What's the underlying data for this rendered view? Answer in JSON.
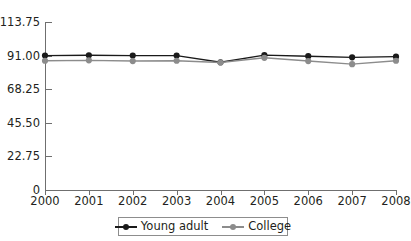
{
  "chart_data": {
    "type": "line",
    "title": "",
    "xlabel": "",
    "ylabel": "",
    "x": [
      "2000",
      "2001",
      "2002",
      "2003",
      "2004",
      "2005",
      "2006",
      "2007",
      "2008"
    ],
    "categories": [
      "2000",
      "2001",
      "2002",
      "2003",
      "2004",
      "2005",
      "2006",
      "2007",
      "2008"
    ],
    "series": [
      {
        "name": "Young adult",
        "color": "#1a1a1a",
        "marker": "circle",
        "values": [
          91.0,
          91.2,
          91.0,
          91.0,
          86.5,
          91.3,
          90.6,
          89.8,
          90.3
        ]
      },
      {
        "name": "College",
        "color": "#8c8c8c",
        "marker": "circle",
        "values": [
          87.5,
          87.8,
          87.3,
          87.5,
          86.3,
          89.5,
          87.3,
          85.2,
          87.5
        ]
      }
    ],
    "ylim": [
      0,
      113.75
    ],
    "yticks": [
      0,
      22.75,
      45.5,
      68.25,
      91.0,
      113.75
    ],
    "ytick_labels": [
      "0",
      "22.75",
      "45.50",
      "68.25",
      "91.00",
      "113.75"
    ],
    "grid": false,
    "legend_position": "bottom"
  },
  "legend": {
    "items": [
      {
        "label": "Young adult",
        "color": "#1a1a1a"
      },
      {
        "label": "College",
        "color": "#8c8c8c"
      }
    ]
  },
  "axes": {
    "y_axis_color": "#6f6f6f",
    "x_axis_color": "#6f6f6f"
  }
}
